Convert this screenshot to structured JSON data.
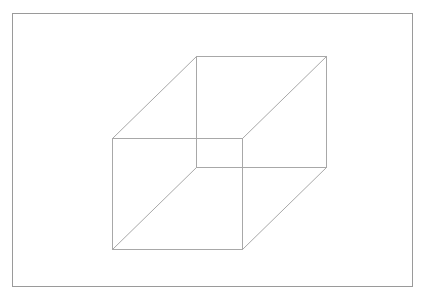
{
  "canvas": {
    "width": 426,
    "height": 298,
    "background_color": "#ffffff",
    "description": "Line drawing of a transparent wireframe cube (Necker cube) inside a thin rectangular border"
  },
  "border_frame": {
    "name": "outer-border-rectangle",
    "x": 12,
    "y": 13,
    "width": 400,
    "height": 273,
    "stroke_color": "#9a9a9a",
    "stroke_width": 1,
    "fill": "none"
  },
  "figure": {
    "name": "wireframe-cube",
    "stroke_color": "#a8a8a8",
    "stroke_width": 1,
    "fill": "none",
    "vertices": {
      "front_top_left": [
        112,
        138
      ],
      "front_top_right": [
        242,
        138
      ],
      "front_bottom_right": [
        242,
        249
      ],
      "front_bottom_left": [
        112,
        249
      ],
      "back_top_left": [
        196,
        56
      ],
      "back_top_right": [
        326,
        56
      ],
      "back_bottom_right": [
        326,
        167
      ],
      "back_bottom_left": [
        196,
        167
      ]
    },
    "edges": [
      {
        "name": "front-top-edge",
        "from": "front_top_left",
        "to": "front_top_right"
      },
      {
        "name": "front-right-edge",
        "from": "front_top_right",
        "to": "front_bottom_right"
      },
      {
        "name": "front-bottom-edge",
        "from": "front_bottom_right",
        "to": "front_bottom_left"
      },
      {
        "name": "front-left-edge",
        "from": "front_bottom_left",
        "to": "front_top_left"
      },
      {
        "name": "back-top-edge",
        "from": "back_top_left",
        "to": "back_top_right"
      },
      {
        "name": "back-right-edge",
        "from": "back_top_right",
        "to": "back_bottom_right"
      },
      {
        "name": "back-bottom-edge",
        "from": "back_bottom_right",
        "to": "back_bottom_left"
      },
      {
        "name": "back-left-edge",
        "from": "back_bottom_left",
        "to": "back_top_left"
      },
      {
        "name": "connector-top-left",
        "from": "front_top_left",
        "to": "back_top_left"
      },
      {
        "name": "connector-top-right",
        "from": "front_top_right",
        "to": "back_top_right"
      },
      {
        "name": "connector-bottom-right",
        "from": "front_bottom_right",
        "to": "back_bottom_right"
      },
      {
        "name": "connector-bottom-left",
        "from": "front_bottom_left",
        "to": "back_bottom_left"
      }
    ]
  }
}
